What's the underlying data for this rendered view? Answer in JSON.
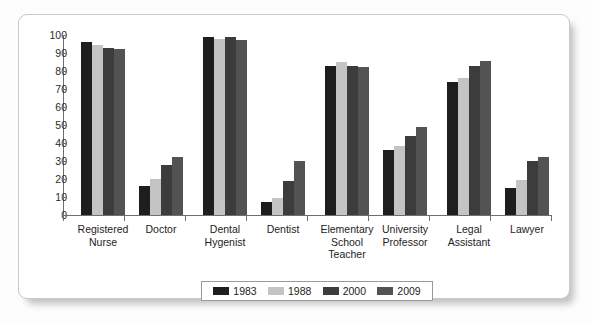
{
  "chart_data": {
    "type": "bar",
    "title": "",
    "xlabel": "",
    "ylabel": "",
    "ylim": [
      0,
      100
    ],
    "ytick_step": 10,
    "grid": false,
    "legend_position": "bottom",
    "yticks": [
      "100",
      "90",
      "80",
      "70",
      "60",
      "50",
      "40",
      "30",
      "20",
      "10",
      "0"
    ],
    "categories": [
      "Registered Nurse",
      "Doctor",
      "Dental Hygenist",
      "Dentist",
      "Elementary School Teacher",
      "University Professor",
      "Legal Assistant",
      "Lawyer"
    ],
    "category_lines": [
      [
        "Registered",
        "Nurse"
      ],
      [
        "Doctor"
      ],
      [
        "Dental",
        "Hygenist"
      ],
      [
        "Dentist"
      ],
      [
        "Elementary",
        "School",
        "Teacher"
      ],
      [
        "University",
        "Professor"
      ],
      [
        "Legal",
        "Assistant"
      ],
      [
        "Lawyer"
      ]
    ],
    "series": [
      {
        "name": "1983",
        "color": "#1e1e1e",
        "values": [
          96,
          16,
          99,
          7,
          83,
          36,
          74,
          15
        ]
      },
      {
        "name": "1988",
        "color": "#c4c4c4",
        "values": [
          94.5,
          20,
          98,
          9.5,
          85,
          38.5,
          76,
          19.5
        ]
      },
      {
        "name": "2000",
        "color": "#3c3c3c",
        "values": [
          93,
          28,
          99,
          19,
          83,
          44,
          83,
          30
        ]
      },
      {
        "name": "2009",
        "color": "#535353",
        "values": [
          92.5,
          32,
          97,
          30,
          82,
          49,
          85.5,
          32
        ]
      }
    ]
  },
  "legend": {
    "entries": [
      "1983",
      "1988",
      "2000",
      "2009"
    ]
  }
}
